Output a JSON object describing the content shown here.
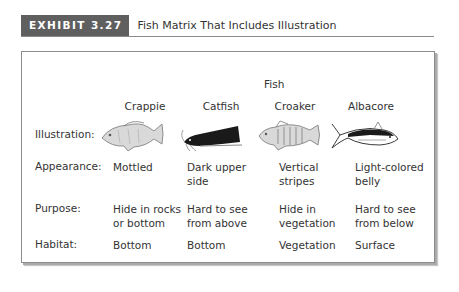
{
  "exhibit": {
    "tag": "EXHIBIT 3.27",
    "title": "Fish Matrix That Includes Illustration",
    "tag_color": "#5f5f5f"
  },
  "matrix": {
    "group_header": "Fish",
    "columns": [
      "Crappie",
      "Catfish",
      "Croaker",
      "Albacore"
    ],
    "rows": [
      {
        "label": "Illustration:",
        "cells": [
          "crappie-illustration",
          "catfish-illustration",
          "croaker-illustration",
          "albacore-illustration"
        ]
      },
      {
        "label": "Appearance:",
        "cells": [
          [
            "Mottled"
          ],
          [
            "Dark upper",
            "side"
          ],
          [
            "Vertical",
            "stripes"
          ],
          [
            "Light-colored",
            "belly"
          ]
        ]
      },
      {
        "label": "Purpose:",
        "cells": [
          [
            "Hide in rocks",
            "or bottom"
          ],
          [
            "Hard to see",
            "from above"
          ],
          [
            "Hide in",
            "vegetation"
          ],
          [
            "Hard to see",
            "from below"
          ]
        ]
      },
      {
        "label": "Habitat:",
        "cells": [
          [
            "Bottom"
          ],
          [
            "Bottom"
          ],
          [
            "Vegetation"
          ],
          [
            "Surface"
          ]
        ]
      }
    ]
  }
}
